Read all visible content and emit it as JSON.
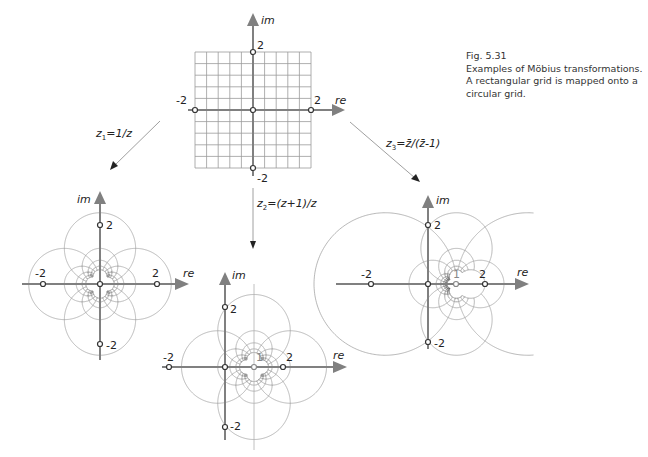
{
  "caption": {
    "figure_number": "Fig. 5.31",
    "line1": "Examples of Möbius transformations.",
    "line2": "A rectangular grid is mapped onto a",
    "line3": "circular grid."
  },
  "axis_labels": {
    "real": "re",
    "imag": "im"
  },
  "formulas": {
    "z1": {
      "prefix": "z",
      "sub": "1",
      "rest": "=1/z"
    },
    "z2": {
      "prefix": "z",
      "sub": "2",
      "rest": "=(z+1)/z"
    },
    "z3": {
      "prefix": "z",
      "sub": "3",
      "rest": "=z̄/(z̄-1)"
    }
  },
  "colors": {
    "axis": "#808080",
    "grid": "#9a9a9a",
    "text": "#222222",
    "arrow": "#9a9a9a"
  },
  "chart_data": {
    "type": "diagram",
    "title": "Examples of Möbius transformations",
    "grid": {
      "xmin": -2,
      "xmax": 2,
      "ymin": -2,
      "ymax": 2,
      "step": 0.4
    },
    "panels": [
      {
        "id": "original",
        "transform": "z",
        "origin_px": [
          253,
          110
        ],
        "scale_px": 29,
        "ticks": {
          "pos": "2",
          "neg": "-2"
        },
        "labels": {
          "one": ""
        }
      },
      {
        "id": "z1",
        "transform": "1/z",
        "origin_px": [
          100,
          284
        ],
        "scale_px": 28.5,
        "ticks": {
          "pos": "2",
          "neg": "-2"
        },
        "labels": {
          "one": ""
        }
      },
      {
        "id": "z2",
        "transform": "(z+1)/z",
        "origin_px": [
          225,
          367
        ],
        "scale_px": 29,
        "ticks": {
          "pos": "2",
          "neg": "-2"
        },
        "labels": {
          "one": "1"
        }
      },
      {
        "id": "z3",
        "transform": "conj(z)/(conj(z)-1)",
        "origin_px": [
          428,
          284
        ],
        "scale_px": 28.5,
        "ticks": {
          "pos": "2",
          "neg": "-2"
        },
        "labels": {
          "one": "1"
        }
      }
    ]
  }
}
